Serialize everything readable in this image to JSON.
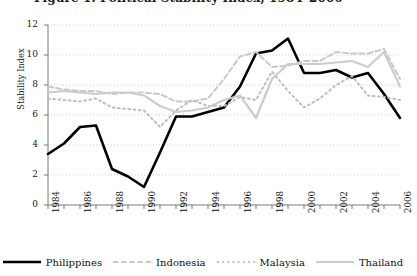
{
  "figure": {
    "title_clipped": "Figure 1. Political Stability Index, 1984–2006",
    "ylabel": "Stability Index"
  },
  "chart_data": {
    "type": "line",
    "title": "Figure 1. Political Stability Index, 1984–2006",
    "xlabel": "",
    "ylabel": "Stability Index",
    "ylim": [
      0,
      12
    ],
    "yticks": [
      0,
      2,
      4,
      6,
      8,
      10,
      12
    ],
    "xlim": [
      1984,
      2006
    ],
    "x": [
      1984,
      1985,
      1986,
      1987,
      1988,
      1989,
      1990,
      1991,
      1992,
      1993,
      1994,
      1995,
      1996,
      1997,
      1998,
      1999,
      2000,
      2001,
      2002,
      2003,
      2004,
      2005,
      2006
    ],
    "xticks": [
      1984,
      1986,
      1988,
      1990,
      1992,
      1994,
      1996,
      1998,
      2000,
      2002,
      2004,
      2006
    ],
    "xtick_labels": [
      "1984",
      "1986",
      "1988",
      "1990",
      "1992",
      "1994",
      "1996",
      "1998",
      "2000",
      "2002",
      "2004",
      "2006"
    ],
    "grid": true,
    "grid_style": "dotted-horizontal",
    "legend_position": "below",
    "series": [
      {
        "name": "Philippines",
        "color": "#000000",
        "style": "solid",
        "width": 2.6,
        "values": [
          3.4,
          4.1,
          5.2,
          5.3,
          2.4,
          1.9,
          1.2,
          3.5,
          5.9,
          5.9,
          6.2,
          6.5,
          7.9,
          10.1,
          10.3,
          11.1,
          8.8,
          8.8,
          9.0,
          8.5,
          8.8,
          7.4,
          5.8
        ]
      },
      {
        "name": "Indonesia",
        "color": "#c9c9c9",
        "style": "dashed",
        "width": 2.0,
        "values": [
          7.9,
          7.7,
          7.6,
          7.6,
          7.4,
          7.5,
          7.5,
          7.4,
          6.9,
          6.9,
          7.1,
          8.4,
          9.9,
          10.2,
          9.2,
          9.3,
          9.6,
          9.6,
          10.2,
          10.1,
          10.1,
          10.4,
          8.4
        ]
      },
      {
        "name": "Malaysia",
        "color": "#bdbdbd",
        "style": "dotted",
        "width": 2.0,
        "values": [
          7.1,
          7.0,
          6.9,
          7.1,
          6.5,
          6.4,
          6.3,
          5.2,
          6.3,
          7.0,
          6.6,
          6.6,
          7.2,
          7.0,
          8.9,
          7.6,
          6.5,
          7.1,
          8.0,
          8.6,
          7.3,
          7.2,
          7.0
        ]
      },
      {
        "name": "Thailand",
        "color": "#cccccc",
        "style": "solid",
        "width": 2.2,
        "values": [
          7.5,
          7.6,
          7.5,
          7.4,
          7.5,
          7.5,
          7.3,
          6.6,
          6.2,
          6.3,
          6.5,
          7.0,
          7.3,
          5.8,
          8.4,
          9.4,
          9.4,
          9.4,
          9.5,
          9.6,
          9.2,
          10.2,
          7.9
        ]
      }
    ]
  }
}
